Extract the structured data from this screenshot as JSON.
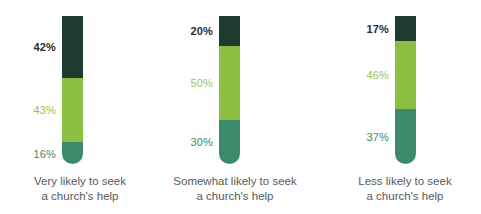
{
  "chart_data": {
    "type": "bar",
    "title": "",
    "subtitle": "",
    "xlabel": "",
    "ylabel": "",
    "ylim": [
      0,
      100
    ],
    "grid": false,
    "legend": "none",
    "stacked": true,
    "normalized_percent": true,
    "orientation": "vertical",
    "categories": [
      "Very likely to seek a church's help",
      "Somewhat likely to seek a church's help",
      "Less likely to seek a church's help"
    ],
    "series": [
      {
        "name": "top",
        "values": [
          42,
          20,
          17
        ],
        "color": "#1d3b30"
      },
      {
        "name": "middle",
        "values": [
          43,
          50,
          46
        ],
        "color": "#8cbe3f"
      },
      {
        "name": "bottom",
        "values": [
          16,
          30,
          37
        ],
        "color": "#3a8a6b"
      }
    ],
    "annotations": [
      "42%",
      "43%",
      "16%",
      "20%",
      "50%",
      "30%",
      "17%",
      "46%",
      "37%"
    ]
  },
  "colors": {
    "dark_green": "#1d3b30",
    "lime_green": "#8cbe3f",
    "teal_green": "#3a8a6b",
    "caption_gray": "#58595b",
    "background": "#ffffff"
  },
  "bars": [
    {
      "caption_line1": "Very likely to seek",
      "caption_line2": "a church's help",
      "segments": [
        {
          "label": "42%",
          "value": 42,
          "color": "#1d3b30",
          "label_color": "#2b2b2b"
        },
        {
          "label": "43%",
          "value": 43,
          "color": "#8cbe3f",
          "label_color": "#9cc14f"
        },
        {
          "label": "16%",
          "value": 16,
          "color": "#3a8a6b",
          "label_color": "#3a8a6b"
        }
      ]
    },
    {
      "caption_line1": "Somewhat likely to seek",
      "caption_line2": "a church's help",
      "segments": [
        {
          "label": "20%",
          "value": 20,
          "color": "#1d3b30",
          "label_color": "#2b2b2b"
        },
        {
          "label": "50%",
          "value": 50,
          "color": "#8cbe3f",
          "label_color": "#9cc14f"
        },
        {
          "label": "30%",
          "value": 30,
          "color": "#3a8a6b",
          "label_color": "#3a8a6b"
        }
      ]
    },
    {
      "caption_line1": "Less likely to seek",
      "caption_line2": "a church's help",
      "segments": [
        {
          "label": "17%",
          "value": 17,
          "color": "#1d3b30",
          "label_color": "#2b2b2b"
        },
        {
          "label": "46%",
          "value": 46,
          "color": "#8cbe3f",
          "label_color": "#9cc14f"
        },
        {
          "label": "37%",
          "value": 37,
          "color": "#3a8a6b",
          "label_color": "#3a8a6b"
        }
      ]
    }
  ]
}
